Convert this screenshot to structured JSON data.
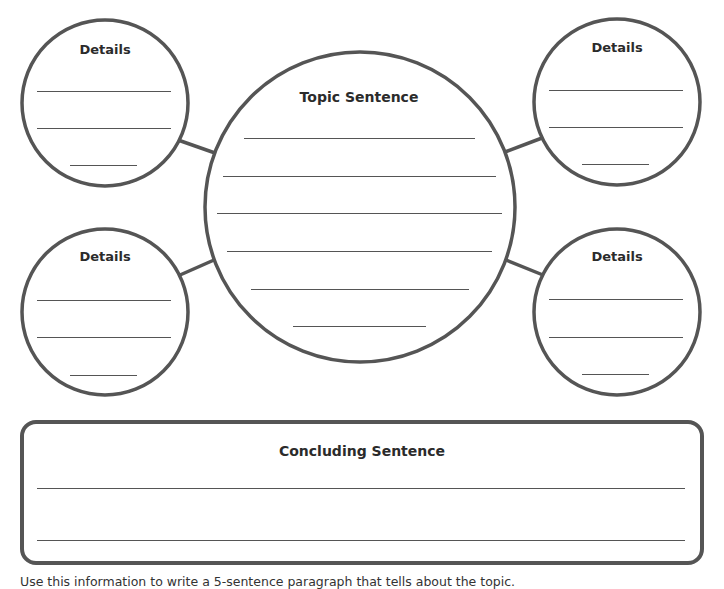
{
  "colors": {
    "stroke": "#555555",
    "text": "#2b2b2b",
    "background": "#ffffff"
  },
  "topic": {
    "title": "Topic Sentence",
    "line_count": 6
  },
  "details": [
    {
      "position": "top-left",
      "title": "Details",
      "line_count": 3
    },
    {
      "position": "top-right",
      "title": "Details",
      "line_count": 3
    },
    {
      "position": "bottom-left",
      "title": "Details",
      "line_count": 3
    },
    {
      "position": "bottom-right",
      "title": "Details",
      "line_count": 3
    }
  ],
  "concluding": {
    "title": "Concluding Sentence",
    "line_count": 2
  },
  "footer": {
    "instructions": "Use this information to write a 5-sentence paragraph that tells about the topic."
  }
}
